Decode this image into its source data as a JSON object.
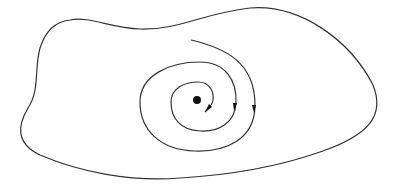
{
  "diagram": {
    "colors": {
      "background": "#ffffff",
      "stroke": "#333333",
      "point": "#111111"
    },
    "elements": [
      {
        "type": "region-boundary",
        "shape": "closed-blob"
      },
      {
        "type": "spiral-trajectory",
        "direction": "inward",
        "arrows": 3
      },
      {
        "type": "fixed-point",
        "shape": "filled-circle"
      }
    ]
  }
}
